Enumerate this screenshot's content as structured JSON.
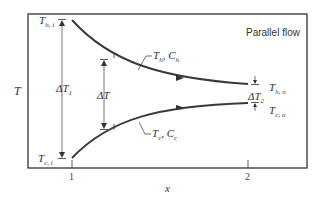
{
  "figure": {
    "title": "Parallel flow",
    "y_axis_label": "T",
    "x_axis_label": "x",
    "x_ticks": [
      "1",
      "2"
    ],
    "labels": {
      "hot_inlet": {
        "main": "T",
        "sub": "h, i"
      },
      "hot_outlet": {
        "main": "T",
        "sub": "h, o"
      },
      "cold_inlet": {
        "main": "T",
        "sub": "c, i"
      },
      "cold_outlet": {
        "main": "T",
        "sub": "c, o"
      },
      "hot_stream": {
        "t": "T",
        "t_sub": "h",
        "sep": ", ",
        "c": "C",
        "c_sub": "h"
      },
      "cold_stream": {
        "t": "T",
        "t_sub": "c",
        "sep": ", ",
        "c": "C",
        "c_sub": "c"
      },
      "delta_t1": {
        "main": "ΔT",
        "sub": "1"
      },
      "delta_t2": {
        "main": "ΔT",
        "sub": "2"
      },
      "delta_t": {
        "main": "ΔT"
      }
    },
    "colors": {
      "curve": "#3a3a3a",
      "frame": "#333333",
      "text": "#333333"
    }
  }
}
